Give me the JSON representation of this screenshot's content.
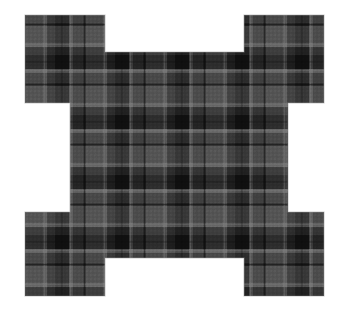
{
  "image": {
    "title": "Tartan plaid fabric swatch",
    "subject": "black-and-grey checked woven cloth cut into a notched cross shape",
    "background_color": "#ffffff",
    "width": 343,
    "height": 318,
    "texture_type": "plaid",
    "fabric_weave": "twill"
  },
  "palette": {
    "base_grey": "#6f6f6f",
    "mid_grey": "#565656",
    "light_grey": "#8c8c8c",
    "pale_line": "#b4b4b4",
    "dark_band": "#191919",
    "deep_black": "#0a0a0a",
    "shadow_edge": "#2c2c2c",
    "background": "#ffffff"
  },
  "shape": {
    "name": "notched-cross",
    "description": "rectangular swatch with four square corner notches removed from the inner edges",
    "outer_bounds": {
      "left": 25,
      "top": 15,
      "right": 324,
      "bottom": 296
    },
    "notch_corners": {
      "top_left": {
        "x": 105,
        "y": 52
      },
      "top_right": {
        "x": 244,
        "y": 52
      },
      "bottom_left": {
        "x": 105,
        "y": 258
      },
      "bottom_right": {
        "x": 244,
        "y": 258
      }
    },
    "waist": {
      "left": 70,
      "right": 288,
      "top": 103,
      "bottom": 212
    },
    "polygon_points": "25,15 105,15 105,52 244,52 244,15 324,15 324,103 288,103 288,212 324,212 324,296 244,296 244,258 105,258 105,296 25,296 25,212 70,212 70,103 25,103"
  },
  "chart_data": {
    "type": "heatmap",
    "repeat_px": 60,
    "stripes": [
      {
        "offset": 0,
        "width": 14,
        "color": "#0d0d0d",
        "label": "black band"
      },
      {
        "offset": 14,
        "width": 4,
        "color": "#b4b4b4",
        "label": "pale guard line"
      },
      {
        "offset": 18,
        "width": 10,
        "color": "#5a5a5a",
        "label": "mid grey"
      },
      {
        "offset": 28,
        "width": 3,
        "color": "#2a2a2a",
        "label": "fine dark line"
      },
      {
        "offset": 31,
        "width": 17,
        "color": "#7d7d7d",
        "label": "light grey ground"
      },
      {
        "offset": 48,
        "width": 4,
        "color": "#b4b4b4",
        "label": "pale guard line"
      },
      {
        "offset": 52,
        "width": 8,
        "color": "#3c3c3c",
        "label": "shadow band"
      }
    ],
    "xlabel": "warp (px)",
    "ylabel": "weft (px)",
    "grid": true,
    "legend": "none"
  }
}
